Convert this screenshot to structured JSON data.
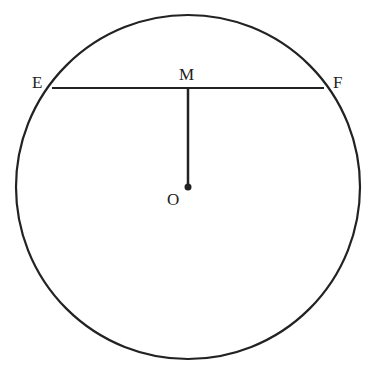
{
  "diagram": {
    "type": "geometry",
    "circle": {
      "center_label": "O",
      "cx": 188,
      "cy": 187,
      "r": 172
    },
    "chord": {
      "from": "E",
      "to": "F"
    },
    "perpendicular": {
      "from": "O",
      "to": "M"
    },
    "labels": {
      "E": "E",
      "F": "F",
      "M": "M",
      "O": "O"
    },
    "colors": {
      "stroke": "#222222",
      "background": "#ffffff"
    }
  }
}
